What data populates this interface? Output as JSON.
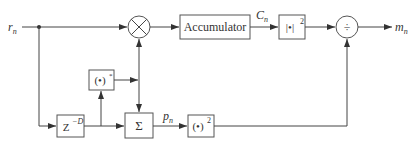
{
  "diagram": {
    "input_label": "r",
    "input_sub": "n",
    "output_label": "m",
    "output_sub": "n",
    "blocks": {
      "multiplier": {
        "symbol": "×"
      },
      "accumulator": {
        "label": "Accumulator"
      },
      "abs_squared": {
        "label": "|•|",
        "sup": "2"
      },
      "divider": {
        "symbol": "÷"
      },
      "conjugate": {
        "label": "(•)",
        "sup": "*"
      },
      "delay": {
        "label": "Z",
        "sup": "−D"
      },
      "summation": {
        "label": "Σ"
      },
      "square": {
        "label": "(•)",
        "sup": "2"
      }
    },
    "signals": {
      "accumulator_output": {
        "label": "C",
        "sub": "n"
      },
      "sum_output": {
        "label": "p",
        "sub": "n"
      }
    }
  }
}
